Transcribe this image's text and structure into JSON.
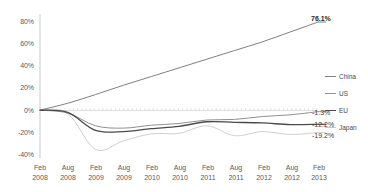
{
  "chart_data": {
    "type": "line",
    "title": "",
    "xlabel": "",
    "ylabel": "",
    "ylim": [
      -40,
      80
    ],
    "ytick_labels": [
      "80%",
      "60%",
      "40%",
      "20%",
      "0%",
      "-20%",
      "-40%"
    ],
    "ytick_values": [
      80,
      60,
      40,
      20,
      0,
      -20,
      -40
    ],
    "grid": false,
    "legend_position": "right",
    "categories": [
      "Feb 2008",
      "Aug 2008",
      "Feb 2009",
      "Aug 2009",
      "Feb 2010",
      "Aug 2010",
      "Feb 2011",
      "Aug 2011",
      "Feb 2012",
      "Aug 2012",
      "Feb 2013"
    ],
    "xtick_labels": [
      {
        "month": "Feb",
        "year": "2008"
      },
      {
        "month": "Aug",
        "year": "2008"
      },
      {
        "month": "Feb",
        "year": "2009"
      },
      {
        "month": "Aug",
        "year": "2009"
      },
      {
        "month": "Feb",
        "year": "2010"
      },
      {
        "month": "Aug",
        "year": "2010"
      },
      {
        "month": "Feb",
        "year": "2011"
      },
      {
        "month": "Aug",
        "year": "2011"
      },
      {
        "month": "Feb",
        "year": "2012"
      },
      {
        "month": "Aug",
        "year": "2012"
      },
      {
        "month": "Feb",
        "year": "2013"
      }
    ],
    "series": [
      {
        "name": "China",
        "color": "#808080",
        "width": 1.0,
        "end_label": "76.1%",
        "end_value": 76.1,
        "values": [
          0,
          6.0,
          13.5,
          21.5,
          29.0,
          36.5,
          44.0,
          51.5,
          59.0,
          67.5,
          76.1
        ]
      },
      {
        "name": "US",
        "color": "#909090",
        "width": 1.0,
        "end_label": "-1.3%",
        "end_value": -1.3,
        "values": [
          0,
          -2.5,
          -13.5,
          -15.5,
          -13.0,
          -11.5,
          -8.5,
          -8.0,
          -5.5,
          -4.0,
          -1.3
        ]
      },
      {
        "name": "EU",
        "color": "#4a4a4a",
        "width": 1.3,
        "end_label": "-12.2%",
        "end_value": -12.2,
        "values": [
          0,
          -2.0,
          -17.5,
          -18.5,
          -16.0,
          -14.0,
          -10.0,
          -10.5,
          -11.0,
          -12.5,
          -12.2
        ]
      },
      {
        "name": "Japan",
        "color": "#d0d0d0",
        "width": 1.0,
        "end_label": "-19.2%",
        "end_value": -19.2,
        "values": [
          0,
          -3.0,
          -34.0,
          -26.5,
          -20.5,
          -20.0,
          -13.5,
          -22.0,
          -18.5,
          -21.0,
          -19.2
        ]
      }
    ],
    "legend": [
      {
        "label": "China",
        "color": "#808080"
      },
      {
        "label": "US",
        "color": "#909090"
      },
      {
        "label": "EU",
        "color": "#4a4a4a"
      },
      {
        "label": "Japan",
        "color": "#c8c8c8"
      }
    ]
  }
}
